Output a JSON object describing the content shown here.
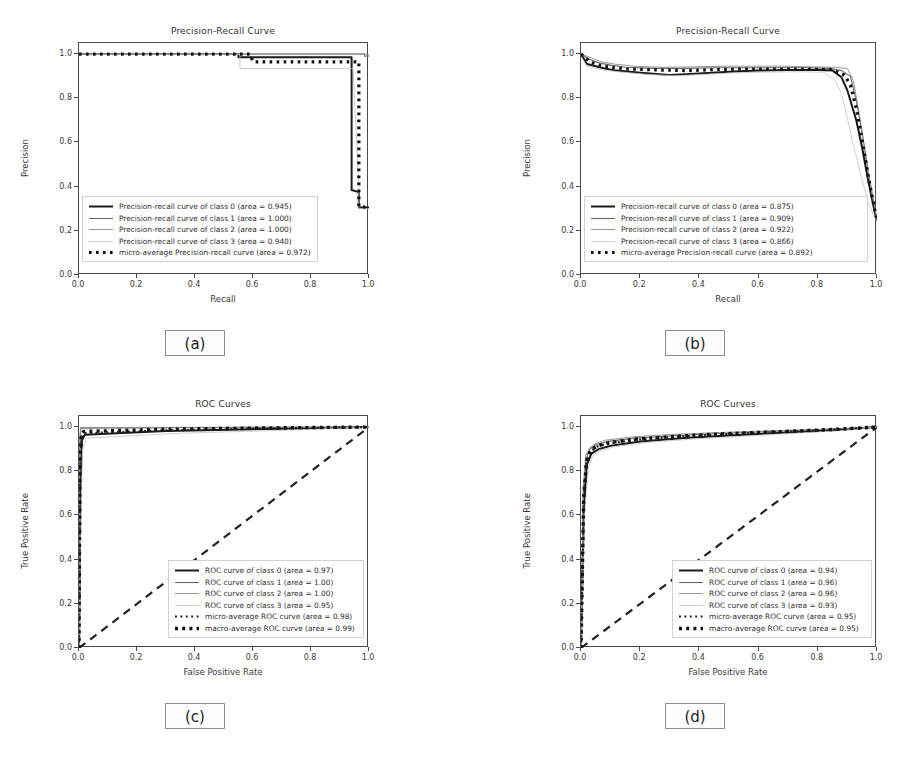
{
  "figure": {
    "width": 910,
    "height": 773,
    "background": "#ffffff",
    "layout": "2x2 grid of model-evaluation curves with lettered captions"
  },
  "panels": [
    {
      "id": "a",
      "caption": "(a)",
      "chart_data": {
        "type": "line",
        "title": "Precision-Recall Curve",
        "xlabel": "Recall",
        "ylabel": "Precision",
        "xlim": [
          0.0,
          1.0
        ],
        "ylim": [
          0.0,
          1.05
        ],
        "xticks": [
          "0.0",
          "0.2",
          "0.4",
          "0.6",
          "0.8",
          "1.0"
        ],
        "yticks": [
          "0.0",
          "0.2",
          "0.4",
          "0.6",
          "0.8",
          "1.0"
        ],
        "grid": false,
        "legend_position": "lower left",
        "series": [
          {
            "name": "Precision-recall curve of class 0 (area = 0.945)",
            "label_prefix": "Precision-recall curve of class 0",
            "area": 0.945,
            "style": "solid-thick",
            "color": "#1a1a1a",
            "x": [
              0.0,
              0.55,
              0.55,
              0.94,
              0.94,
              0.965,
              0.965,
              1.0
            ],
            "y": [
              1.0,
              1.0,
              0.985,
              0.985,
              0.385,
              0.375,
              0.305,
              0.305
            ]
          },
          {
            "name": "Precision-recall curve of class 1 (area = 1.000)",
            "label_prefix": "Precision-recall curve of class 1",
            "area": 1.0,
            "style": "solid-medium",
            "color": "#6e6e6e",
            "x": [
              0.0,
              0.985,
              0.985,
              1.0
            ],
            "y": [
              1.0,
              1.0,
              0.99,
              0.99
            ]
          },
          {
            "name": "Precision-recall curve of class 2 (area = 1.000)",
            "label_prefix": "Precision-recall curve of class 2",
            "area": 1.0,
            "style": "solid-thin",
            "color": "#8a8a8a",
            "x": [
              0.0,
              0.99,
              0.99,
              1.0
            ],
            "y": [
              1.0,
              1.0,
              0.995,
              0.995
            ]
          },
          {
            "name": "Precision-recall curve of class 3 (area = 0.940)",
            "label_prefix": "Precision-recall curve of class 3",
            "area": 0.94,
            "style": "solid-light",
            "color": "#c0c0c0",
            "x": [
              0.0,
              0.555,
              0.555,
              0.945,
              0.945,
              0.965,
              0.965,
              1.0
            ],
            "y": [
              1.0,
              1.0,
              0.935,
              0.935,
              0.935,
              0.4,
              0.3,
              0.3
            ]
          },
          {
            "name": "micro-average Precision-recall curve (area = 0.972)",
            "label_prefix": "micro-average Precision-recall curve",
            "area": 0.972,
            "style": "dotted-square",
            "color": "#111111",
            "x": [
              0.0,
              0.59,
              0.6,
              0.965,
              0.965,
              1.0
            ],
            "y": [
              1.0,
              1.0,
              0.965,
              0.965,
              0.31,
              0.305
            ]
          }
        ]
      }
    },
    {
      "id": "b",
      "caption": "(b)",
      "chart_data": {
        "type": "line",
        "title": "Precision-Recall Curve",
        "xlabel": "Recall",
        "ylabel": "Precision",
        "xlim": [
          0.0,
          1.0
        ],
        "ylim": [
          0.0,
          1.05
        ],
        "xticks": [
          "0.0",
          "0.2",
          "0.4",
          "0.6",
          "0.8",
          "1.0"
        ],
        "yticks": [
          "0.0",
          "0.2",
          "0.4",
          "0.6",
          "0.8",
          "1.0"
        ],
        "grid": false,
        "legend_position": "lower left",
        "series": [
          {
            "name": "Precision-recall curve of class 0 (area = 0.875)",
            "label_prefix": "Precision-recall curve of class 0",
            "area": 0.875,
            "style": "solid-thick",
            "color": "#1a1a1a",
            "x": [
              0.0,
              0.02,
              0.05,
              0.08,
              0.12,
              0.2,
              0.3,
              0.4,
              0.5,
              0.6,
              0.7,
              0.8,
              0.85,
              0.88,
              0.9,
              0.93,
              0.95,
              0.97,
              0.99,
              1.0
            ],
            "y": [
              1.0,
              0.955,
              0.945,
              0.935,
              0.925,
              0.915,
              0.905,
              0.912,
              0.92,
              0.925,
              0.928,
              0.928,
              0.925,
              0.895,
              0.835,
              0.7,
              0.575,
              0.43,
              0.3,
              0.245
            ]
          },
          {
            "name": "Precision-recall curve of class 1 (area = 0.909)",
            "label_prefix": "Precision-recall curve of class 1",
            "area": 0.909,
            "style": "solid-medium",
            "color": "#6a6a6a",
            "x": [
              0.0,
              0.03,
              0.06,
              0.1,
              0.15,
              0.25,
              0.35,
              0.45,
              0.55,
              0.65,
              0.75,
              0.84,
              0.88,
              0.91,
              0.93,
              0.95,
              0.97,
              0.99,
              1.0
            ],
            "y": [
              1.0,
              0.975,
              0.96,
              0.95,
              0.94,
              0.935,
              0.935,
              0.938,
              0.938,
              0.938,
              0.938,
              0.935,
              0.925,
              0.9,
              0.79,
              0.64,
              0.47,
              0.32,
              0.25
            ]
          },
          {
            "name": "Precision-recall curve of class 2 (area = 0.922)",
            "label_prefix": "Precision-recall curve of class 2",
            "area": 0.922,
            "style": "solid-thin",
            "color": "#8c8c8c",
            "x": [
              0.0,
              0.03,
              0.07,
              0.11,
              0.18,
              0.28,
              0.38,
              0.48,
              0.58,
              0.68,
              0.78,
              0.86,
              0.9,
              0.92,
              0.94,
              0.96,
              0.98,
              1.0
            ],
            "y": [
              1.0,
              0.985,
              0.965,
              0.955,
              0.945,
              0.94,
              0.942,
              0.945,
              0.945,
              0.945,
              0.942,
              0.94,
              0.935,
              0.88,
              0.73,
              0.56,
              0.39,
              0.255
            ]
          },
          {
            "name": "Precision-recall curve of class 3 (area = 0.866)",
            "label_prefix": "Precision-recall curve of class 3",
            "area": 0.866,
            "style": "solid-light",
            "color": "#c4c4c4",
            "x": [
              0.0,
              0.02,
              0.05,
              0.09,
              0.14,
              0.22,
              0.32,
              0.42,
              0.52,
              0.62,
              0.72,
              0.82,
              0.86,
              0.88,
              0.9,
              0.92,
              0.95,
              0.97,
              0.99,
              1.0
            ],
            "y": [
              0.99,
              0.945,
              0.935,
              0.925,
              0.918,
              0.908,
              0.902,
              0.908,
              0.915,
              0.918,
              0.92,
              0.918,
              0.88,
              0.82,
              0.71,
              0.59,
              0.43,
              0.33,
              0.265,
              0.24
            ]
          },
          {
            "name": "micro-average Precision-recall curve (area = 0.892)",
            "label_prefix": "micro-average Precision-recall curve",
            "area": 0.892,
            "style": "dotted-square",
            "color": "#111111",
            "x": [
              0.0,
              0.03,
              0.06,
              0.1,
              0.16,
              0.26,
              0.36,
              0.46,
              0.56,
              0.66,
              0.76,
              0.85,
              0.89,
              0.91,
              0.93,
              0.95,
              0.97,
              0.99,
              1.0
            ],
            "y": [
              1.0,
              0.965,
              0.95,
              0.94,
              0.932,
              0.928,
              0.925,
              0.93,
              0.932,
              0.932,
              0.932,
              0.93,
              0.905,
              0.86,
              0.755,
              0.61,
              0.45,
              0.31,
              0.248
            ]
          }
        ]
      }
    },
    {
      "id": "c",
      "caption": "(c)",
      "chart_data": {
        "type": "line",
        "title": "ROC Curves",
        "xlabel": "False Positive Rate",
        "ylabel": "True Positive Rate",
        "xlim": [
          0.0,
          1.0
        ],
        "ylim": [
          0.0,
          1.05
        ],
        "xticks": [
          "0.0",
          "0.2",
          "0.4",
          "0.6",
          "0.8",
          "1.0"
        ],
        "yticks": [
          "0.0",
          "0.2",
          "0.4",
          "0.6",
          "0.8",
          "1.0"
        ],
        "grid": false,
        "legend_position": "lower right",
        "chance_line": {
          "name": "chance",
          "style": "dashed",
          "x": [
            0,
            1
          ],
          "y": [
            0,
            1
          ]
        },
        "series": [
          {
            "name": "ROC curve of class 0 (area = 0.97)",
            "label_prefix": "ROC curve of class 0",
            "area": 0.97,
            "style": "solid-thick",
            "color": "#1a1a1a",
            "x": [
              0.0,
              0.005,
              0.01,
              0.02,
              0.3,
              0.6,
              1.0
            ],
            "y": [
              0.0,
              0.7,
              0.94,
              0.965,
              0.982,
              0.99,
              1.0
            ]
          },
          {
            "name": "ROC curve of class 1 (area = 1.00)",
            "label_prefix": "ROC curve of class 1",
            "area": 1.0,
            "style": "solid-medium",
            "color": "#6a6a6a",
            "x": [
              0.0,
              0.003,
              0.006,
              0.5,
              1.0
            ],
            "y": [
              0.0,
              0.9,
              0.995,
              0.998,
              1.0
            ]
          },
          {
            "name": "ROC curve of class 2 (area = 1.00)",
            "label_prefix": "ROC curve of class 2",
            "area": 1.0,
            "style": "solid-thin",
            "color": "#8c8c8c",
            "x": [
              0.0,
              0.002,
              0.005,
              0.5,
              1.0
            ],
            "y": [
              0.0,
              0.94,
              0.998,
              0.999,
              1.0
            ]
          },
          {
            "name": "ROC curve of class 3 (area = 0.95)",
            "label_prefix": "ROC curve of class 3",
            "area": 0.95,
            "style": "solid-light",
            "color": "#c4c4c4",
            "x": [
              0.0,
              0.006,
              0.012,
              0.025,
              0.35,
              0.7,
              1.0
            ],
            "y": [
              0.0,
              0.56,
              0.9,
              0.95,
              0.972,
              0.985,
              1.0
            ]
          },
          {
            "name": "micro-average ROC curve (area = 0.98)",
            "label_prefix": "micro-average ROC curve",
            "area": 0.98,
            "style": "dotted-small",
            "color": "#222222",
            "x": [
              0.0,
              0.004,
              0.009,
              0.018,
              0.3,
              0.65,
              1.0
            ],
            "y": [
              0.0,
              0.8,
              0.955,
              0.972,
              0.985,
              0.993,
              1.0
            ]
          },
          {
            "name": "macro-average ROC curve (area = 0.99)",
            "label_prefix": "macro-average ROC curve",
            "area": 0.99,
            "style": "dotted-large",
            "color": "#111111",
            "x": [
              0.0,
              0.003,
              0.008,
              0.016,
              0.3,
              0.65,
              1.0
            ],
            "y": [
              0.0,
              0.85,
              0.968,
              0.98,
              0.99,
              0.996,
              1.0
            ]
          }
        ]
      }
    },
    {
      "id": "d",
      "caption": "(d)",
      "chart_data": {
        "type": "line",
        "title": "ROC Curves",
        "xlabel": "False Positive Rate",
        "ylabel": "True Positive Rate",
        "xlim": [
          0.0,
          1.0
        ],
        "ylim": [
          0.0,
          1.05
        ],
        "xticks": [
          "0.0",
          "0.2",
          "0.4",
          "0.6",
          "0.8",
          "1.0"
        ],
        "yticks": [
          "0.0",
          "0.2",
          "0.4",
          "0.6",
          "0.8",
          "1.0"
        ],
        "grid": false,
        "legend_position": "lower right",
        "chance_line": {
          "name": "chance",
          "style": "dashed",
          "x": [
            0,
            1
          ],
          "y": [
            0,
            1
          ]
        },
        "series": [
          {
            "name": "ROC curve of class 0 (area = 0.94)",
            "label_prefix": "ROC curve of class 0",
            "area": 0.94,
            "style": "solid-thick",
            "color": "#1a1a1a",
            "x": [
              0.0,
              0.01,
              0.02,
              0.035,
              0.06,
              0.1,
              0.2,
              0.35,
              0.5,
              0.7,
              0.85,
              1.0
            ],
            "y": [
              0.0,
              0.64,
              0.83,
              0.88,
              0.9,
              0.915,
              0.935,
              0.95,
              0.962,
              0.975,
              0.985,
              1.0
            ]
          },
          {
            "name": "ROC curve of class 1 (area = 0.96)",
            "label_prefix": "ROC curve of class 1",
            "area": 0.96,
            "style": "solid-medium",
            "color": "#6a6a6a",
            "x": [
              0.0,
              0.008,
              0.018,
              0.03,
              0.05,
              0.09,
              0.18,
              0.32,
              0.48,
              0.68,
              0.84,
              1.0
            ],
            "y": [
              0.0,
              0.7,
              0.86,
              0.9,
              0.92,
              0.935,
              0.95,
              0.962,
              0.972,
              0.982,
              0.99,
              1.0
            ]
          },
          {
            "name": "ROC curve of class 2 (area = 0.96)",
            "label_prefix": "ROC curve of class 2",
            "area": 0.96,
            "style": "solid-thin",
            "color": "#8c8c8c",
            "x": [
              0.0,
              0.007,
              0.016,
              0.028,
              0.05,
              0.08,
              0.17,
              0.3,
              0.46,
              0.66,
              0.83,
              1.0
            ],
            "y": [
              0.0,
              0.72,
              0.87,
              0.905,
              0.925,
              0.94,
              0.955,
              0.966,
              0.975,
              0.984,
              0.991,
              1.0
            ]
          },
          {
            "name": "ROC curve of class 3 (area = 0.93)",
            "label_prefix": "ROC curve of class 3",
            "area": 0.93,
            "style": "solid-light",
            "color": "#c4c4c4",
            "x": [
              0.0,
              0.012,
              0.024,
              0.04,
              0.07,
              0.11,
              0.22,
              0.38,
              0.54,
              0.72,
              0.87,
              1.0
            ],
            "y": [
              0.0,
              0.6,
              0.81,
              0.87,
              0.895,
              0.91,
              0.93,
              0.946,
              0.958,
              0.972,
              0.983,
              1.0
            ]
          },
          {
            "name": "micro-average ROC curve (area = 0.95)",
            "label_prefix": "micro-average ROC curve",
            "area": 0.95,
            "style": "dotted-small",
            "color": "#222222",
            "x": [
              0.0,
              0.009,
              0.019,
              0.032,
              0.055,
              0.095,
              0.19,
              0.33,
              0.49,
              0.69,
              0.85,
              1.0
            ],
            "y": [
              0.0,
              0.67,
              0.845,
              0.89,
              0.912,
              0.926,
              0.943,
              0.957,
              0.968,
              0.979,
              0.988,
              1.0
            ]
          },
          {
            "name": "macro-average ROC curve (area = 0.95)",
            "label_prefix": "macro-average ROC curve",
            "area": 0.95,
            "style": "dotted-large",
            "color": "#111111",
            "x": [
              0.0,
              0.009,
              0.019,
              0.032,
              0.055,
              0.095,
              0.19,
              0.33,
              0.49,
              0.69,
              0.85,
              1.0
            ],
            "y": [
              0.0,
              0.675,
              0.85,
              0.893,
              0.915,
              0.929,
              0.946,
              0.959,
              0.97,
              0.98,
              0.989,
              1.0
            ]
          }
        ]
      }
    }
  ]
}
